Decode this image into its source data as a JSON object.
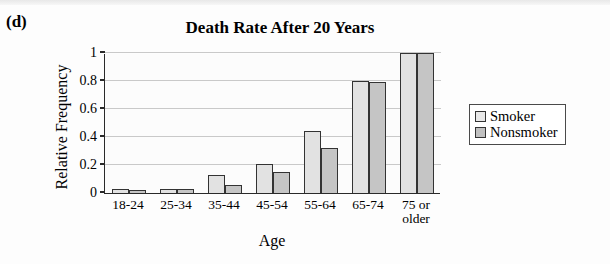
{
  "panel_letter": "(d)",
  "chart_data": {
    "type": "bar",
    "title": "Death Rate After 20 Years",
    "xlabel": "Age",
    "ylabel": "Relative Frequency",
    "categories": [
      "18-24",
      "25-34",
      "35-44",
      "45-54",
      "55-64",
      "65-74",
      "75 or\nolder"
    ],
    "series": [
      {
        "name": "Smoker",
        "values": [
          0.03,
          0.03,
          0.13,
          0.21,
          0.44,
          0.8,
          1.0
        ],
        "color": "#e2e2e2"
      },
      {
        "name": "Nonsmoker",
        "values": [
          0.02,
          0.03,
          0.06,
          0.15,
          0.32,
          0.79,
          1.0
        ],
        "color": "#c5c5c5"
      }
    ],
    "ylim": [
      0,
      1
    ],
    "yticks": [
      0,
      0.2,
      0.4,
      0.6,
      0.8,
      1
    ],
    "ytick_labels": [
      "0",
      "0.2",
      "0.4",
      "0.6",
      "0.8",
      "1"
    ],
    "grid": true,
    "legend_position": "right",
    "legend": [
      "Smoker",
      "Nonsmoker"
    ]
  }
}
